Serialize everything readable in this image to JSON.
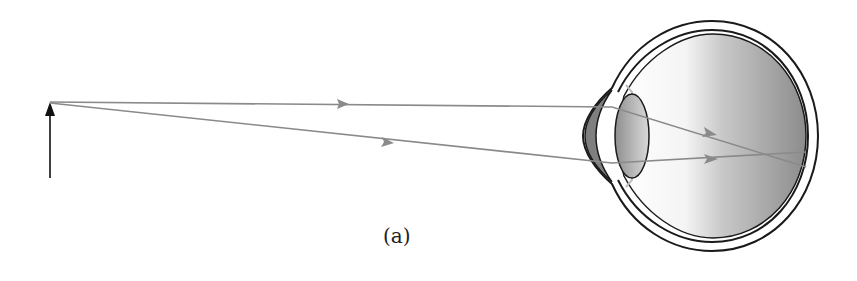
{
  "figure": {
    "caption": "(a)",
    "colors": {
      "ray": "#8a8a8a",
      "outline": "#1a1a1a",
      "object_arrow": "#111111",
      "vitreous_light": "#ffffff",
      "vitreous_dark": "#8c8c8c",
      "lens_fill": "#9a9a9a",
      "cornea_fill": "#7f7f7f"
    }
  },
  "object": {
    "label": "object-arrow"
  },
  "rays": [
    {
      "name": "top-ray"
    },
    {
      "name": "bottom-ray"
    }
  ]
}
